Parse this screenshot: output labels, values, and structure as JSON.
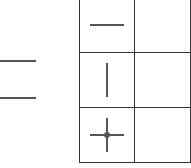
{
  "diagram": {
    "left_lines": [
      {
        "name": "upper-line"
      },
      {
        "name": "lower-line"
      }
    ],
    "table": {
      "rows": [
        {
          "symbol": "horizontal-line-icon",
          "value": ""
        },
        {
          "symbol": "vertical-line-icon",
          "value": ""
        },
        {
          "symbol": "crosshair-point-icon",
          "value": ""
        }
      ]
    },
    "colors": {
      "line": "#555555",
      "border": "#333333"
    }
  }
}
